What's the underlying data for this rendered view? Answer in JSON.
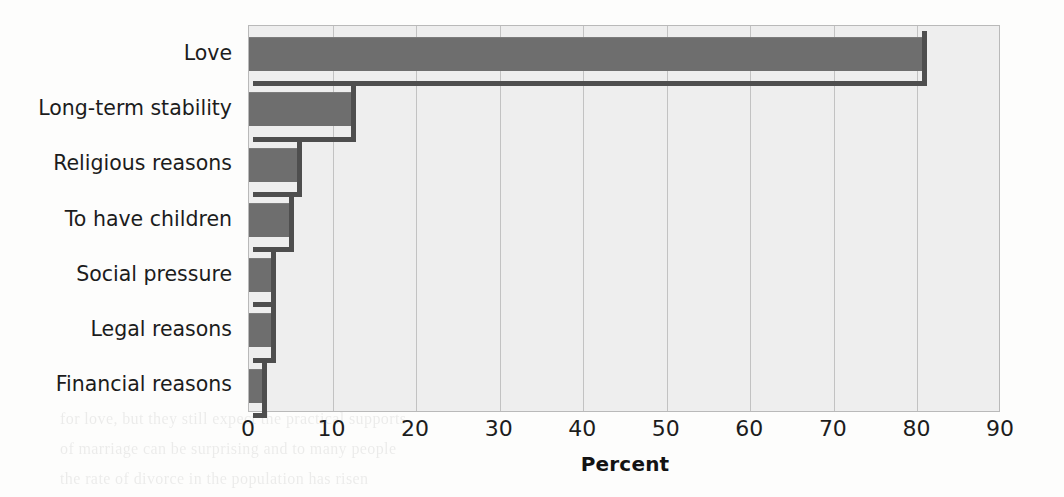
{
  "chart_data": {
    "type": "bar",
    "orientation": "horizontal",
    "title": "",
    "subtitle": "",
    "xlabel": "Percent",
    "ylabel": "",
    "xlim": [
      0,
      90
    ],
    "xticks": [
      0,
      10,
      20,
      30,
      40,
      50,
      60,
      70,
      80,
      90
    ],
    "xtick_labels": [
      "0",
      "10",
      "20",
      "30",
      "40",
      "50",
      "60",
      "70",
      "80",
      "90"
    ],
    "grid": "vertical",
    "legend": "none",
    "categories": [
      "Love",
      "Long-term stability",
      "Religious reasons",
      "To have children",
      "Social pressure",
      "Legal reasons",
      "Financial reasons"
    ],
    "values": [
      80.5,
      12.2,
      5.7,
      4.8,
      2.6,
      2.6,
      1.6
    ],
    "series": [
      {
        "name": "Percent",
        "values": [
          80.5,
          12.2,
          5.7,
          4.8,
          2.6,
          2.6,
          1.6
        ]
      }
    ],
    "annotations": []
  },
  "style": {
    "bar_color": "#6e6e6e",
    "bar_shadow_color": "#4e4e4e",
    "plot_background": "#eeeeee",
    "gridline_color": "#c2c2c2",
    "axis_border_color": "#b9b9b9",
    "page_background": "#fdfdfc",
    "text_color": "#1c1c1c"
  },
  "ghost_text": [
    {
      "x": 300,
      "y": 88,
      "text": "Marriage and Divorce",
      "bold": true
    },
    {
      "x": 300,
      "y": 128,
      "text": "Marriage is the practice of joining two people in a"
    },
    {
      "x": 300,
      "y": 154,
      "text": "legal, social, and economic relationship that is recognized"
    },
    {
      "x": 300,
      "y": 180,
      "text": "close to the universal of marriage in human societies."
    },
    {
      "x": 300,
      "y": 206,
      "text": "they vary in form and substance from place to place."
    },
    {
      "x": 300,
      "y": 232,
      "text": "marriage, and that divorce is becoming more common."
    },
    {
      "x": 300,
      "y": 258,
      "text": "people who decide to marry. Research on the reasons that"
    },
    {
      "x": 300,
      "y": 284,
      "text": "adults say love is the most important reason to marry."
    },
    {
      "x": 300,
      "y": 310,
      "text": "important in the past were the practical benefits that"
    },
    {
      "x": 300,
      "y": 336,
      "text": "which made marriage a primarily economic arrangement."
    },
    {
      "x": 60,
      "y": 410,
      "text": "for love, but they still expect the practical supports"
    },
    {
      "x": 60,
      "y": 440,
      "text": "of marriage can be surprising and to many people"
    },
    {
      "x": 60,
      "y": 470,
      "text": "the rate of divorce in the population has risen"
    }
  ]
}
